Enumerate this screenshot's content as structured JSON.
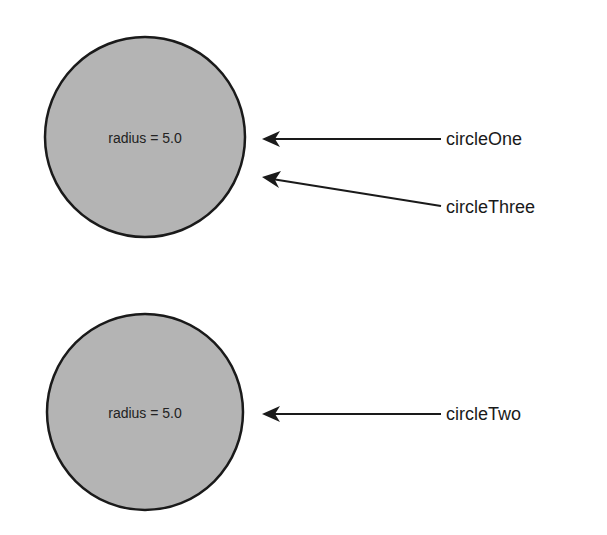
{
  "colors": {
    "background": "#ffffff",
    "circle_fill": "#b4b4b4",
    "stroke": "#1a1a1a",
    "text": "#1a1a1a"
  },
  "objects": [
    {
      "id": "top",
      "text": "radius = 5.0",
      "cx": 145,
      "cy": 137,
      "r": 100
    },
    {
      "id": "bottom",
      "text": "radius = 5.0",
      "cx": 145,
      "cy": 412,
      "r": 98
    }
  ],
  "references": [
    {
      "label": "circleOne",
      "points_to": "top",
      "from": [
        441,
        139
      ],
      "to": [
        262,
        139
      ],
      "label_pos": [
        446,
        145
      ]
    },
    {
      "label": "circleThree",
      "points_to": "top",
      "from": [
        441,
        206
      ],
      "to": [
        262,
        177
      ],
      "label_pos": [
        446,
        213
      ]
    },
    {
      "label": "circleTwo",
      "points_to": "bottom",
      "from": [
        441,
        414
      ],
      "to": [
        262,
        414
      ],
      "label_pos": [
        446,
        420
      ]
    }
  ]
}
